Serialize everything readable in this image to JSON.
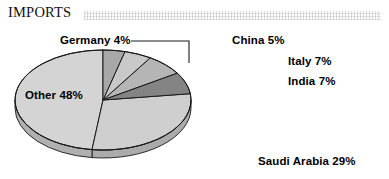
{
  "header": {
    "title": "IMPORTS",
    "rule_style": "hatched-gray-bar"
  },
  "chart_data": {
    "type": "pie",
    "title": "IMPORTS",
    "subtitle": "",
    "xlabel": "",
    "ylabel": "",
    "three_d": true,
    "legend_position": "none",
    "labels_on_slices": false,
    "grid": false,
    "start_angle_deg": 0,
    "direction": "clockwise",
    "categories": [
      "Germany",
      "China",
      "Italy",
      "India",
      "Saudi Arabia",
      "Other"
    ],
    "values": [
      4,
      5,
      7,
      7,
      29,
      48
    ],
    "unit": "%",
    "total": 100,
    "slices": [
      {
        "name": "Germany",
        "value": 4,
        "label": "Germany 4%",
        "color": "#a8a8a8",
        "side_color": "#8e8e8e",
        "leader_line": true
      },
      {
        "name": "China",
        "value": 5,
        "label": "China 5%",
        "color": "#c9c9c9",
        "side_color": "#ababab",
        "leader_line": false
      },
      {
        "name": "Italy",
        "value": 7,
        "label": "Italy 7%",
        "color": "#b5b5b5",
        "side_color": "#9b9b9b",
        "leader_line": false
      },
      {
        "name": "India",
        "value": 7,
        "label": "India 7%",
        "color": "#848484",
        "side_color": "#6e6e6e",
        "leader_line": false
      },
      {
        "name": "Saudi Arabia",
        "value": 29,
        "label": "Saudi Arabia 29%",
        "color": "#cfcfcf",
        "side_color": "#ababab",
        "leader_line": false
      },
      {
        "name": "Other",
        "value": 48,
        "label": "Other 48%",
        "color": "#d4d4d4",
        "side_color": "#b0b0b0",
        "leader_line": false
      }
    ],
    "colors": {
      "outline": "#1a1a1a",
      "background": "#ffffff",
      "text": "#000000",
      "header_rule": "#e8e8e8"
    }
  }
}
